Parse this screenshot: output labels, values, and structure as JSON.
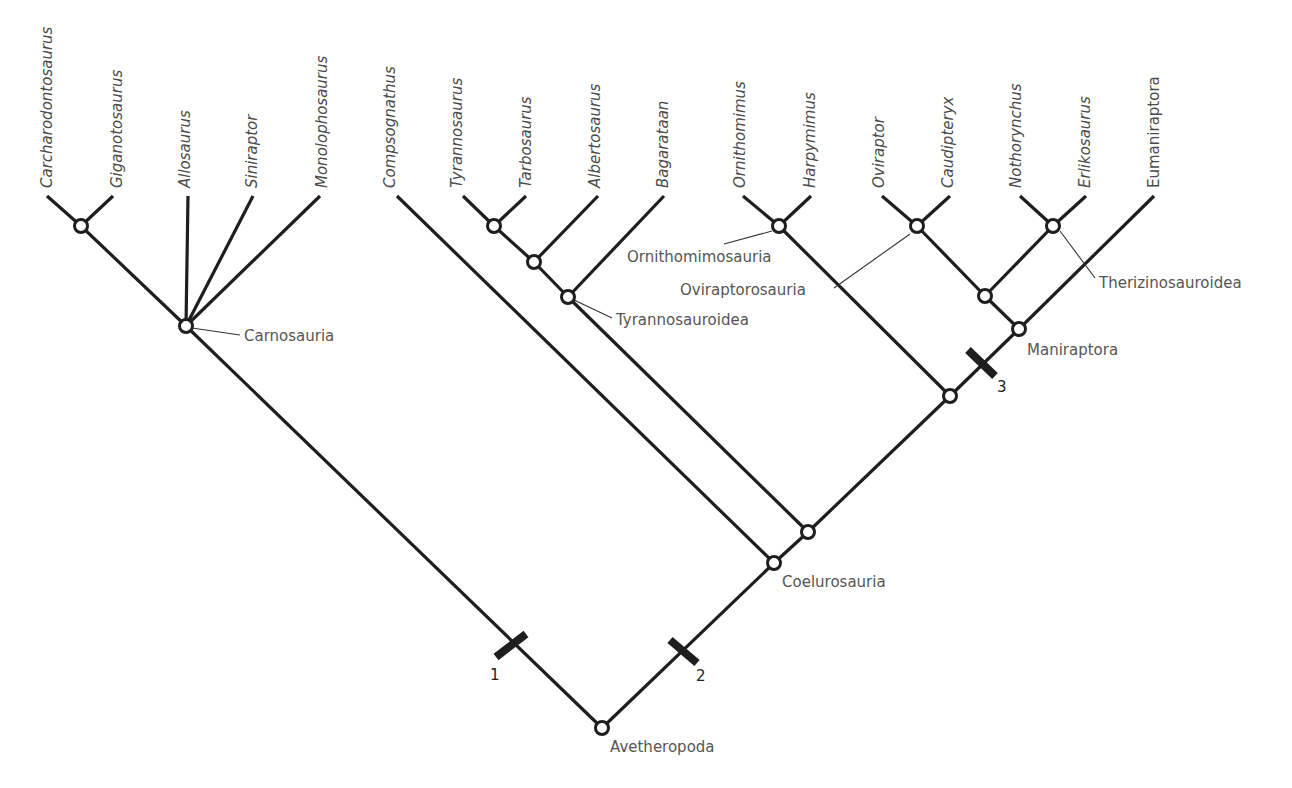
{
  "diagram": {
    "type": "cladogram",
    "root": "Avetheropoda",
    "taxa": [
      {
        "name": "Carcharodontosaurus",
        "italic": true
      },
      {
        "name": "Giganotosaurus",
        "italic": true
      },
      {
        "name": "Allosaurus",
        "italic": true
      },
      {
        "name": "Siniraptor",
        "italic": true
      },
      {
        "name": "Monolophosaurus",
        "italic": true
      },
      {
        "name": "Compsognathus",
        "italic": true
      },
      {
        "name": "Tyrannosaurus",
        "italic": true
      },
      {
        "name": "Tarbosaurus",
        "italic": true
      },
      {
        "name": "Albertosaurus",
        "italic": true
      },
      {
        "name": "Bagarataan",
        "italic": true
      },
      {
        "name": "Ornithomimus",
        "italic": true
      },
      {
        "name": "Harpymimus",
        "italic": true
      },
      {
        "name": "Oviraptor",
        "italic": true
      },
      {
        "name": "Caudipteryx",
        "italic": true
      },
      {
        "name": "Nothorynchus",
        "italic": true
      },
      {
        "name": "Erlikosaurus",
        "italic": true
      },
      {
        "name": "Eumaniraptora",
        "italic": false
      }
    ],
    "clades": {
      "carnosauria": "Carnosauria",
      "tyrannosauroidea": "Tyrannosauroidea",
      "ornithomimosauria": "Ornithomimosauria",
      "oviraptorosauria": "Oviraptorosauria",
      "therizinosauroidea": "Therizinosauroidea",
      "maniraptora": "Maniraptora",
      "coelurosauria": "Coelurosauria",
      "avetheropoda": "Avetheropoda"
    },
    "character_marks": [
      "1",
      "2",
      "3"
    ],
    "colors": {
      "line": "#1e1e1e",
      "label": "#555555",
      "background": "#ffffff"
    }
  }
}
